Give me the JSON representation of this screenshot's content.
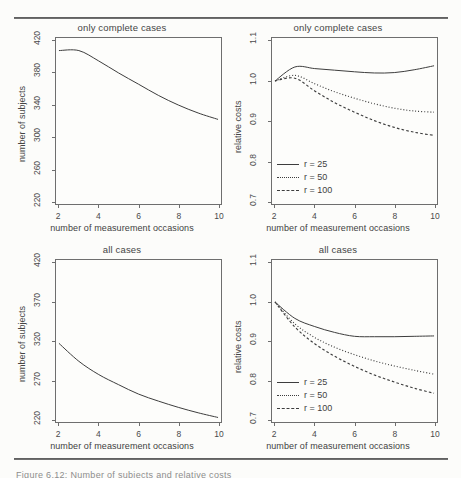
{
  "page": {
    "caption_sliver": "Figure 6.12: Number of subjects and relative costs"
  },
  "axis": {
    "x_label": "number of measurement occasions",
    "x_ticks": [
      "2",
      "4",
      "6",
      "8",
      "10"
    ],
    "y_label_subjects": "number of subjects",
    "y_label_costs": "relative costs",
    "y_ticks_tl": [
      "220",
      "260",
      "300",
      "340",
      "380",
      "420"
    ],
    "y_ticks_bl": [
      "220",
      "270",
      "320",
      "370",
      "420"
    ],
    "y_ticks_right": [
      "0.7",
      "0.8",
      "0.9",
      "1.0",
      "1.1"
    ]
  },
  "legend": {
    "items": [
      {
        "label": "r = 25",
        "style": "solid"
      },
      {
        "label": "r = 50",
        "style": "dotted"
      },
      {
        "label": "r = 100",
        "style": "dashed"
      }
    ]
  },
  "titles": {
    "complete": "only complete cases",
    "all": "all cases"
  },
  "chart_data": [
    {
      "id": "top-left",
      "type": "line",
      "title": "only complete cases",
      "xlabel": "number of measurement occasions",
      "ylabel": "number of subjects",
      "xlim": [
        2,
        10
      ],
      "ylim": [
        220,
        420
      ],
      "xticks": [
        2,
        4,
        6,
        8,
        10
      ],
      "yticks": [
        220,
        260,
        300,
        340,
        380,
        420
      ],
      "grid": false,
      "legend": "none",
      "series": [
        {
          "name": "number of subjects",
          "style": "solid",
          "x": [
            2,
            3,
            4,
            5,
            6,
            7,
            8,
            9,
            10
          ],
          "values": [
            408,
            408,
            395,
            380,
            366,
            352,
            340,
            330,
            322
          ]
        }
      ]
    },
    {
      "id": "top-right",
      "type": "line",
      "title": "only complete cases",
      "xlabel": "number of measurement occasions",
      "ylabel": "relative costs",
      "xlim": [
        2,
        10
      ],
      "ylim": [
        0.7,
        1.1
      ],
      "xticks": [
        2,
        4,
        6,
        8,
        10
      ],
      "yticks": [
        0.7,
        0.8,
        0.9,
        1.0,
        1.1
      ],
      "grid": false,
      "legend": "bottom-left",
      "series": [
        {
          "name": "r = 25",
          "style": "solid",
          "x": [
            2,
            3,
            4,
            5,
            6,
            7,
            8,
            9,
            10
          ],
          "values": [
            1.0,
            1.035,
            1.031,
            1.027,
            1.023,
            1.02,
            1.021,
            1.028,
            1.038
          ]
        },
        {
          "name": "r = 50",
          "style": "dotted",
          "x": [
            2,
            3,
            4,
            5,
            6,
            7,
            8,
            9,
            10
          ],
          "values": [
            1.0,
            1.014,
            0.993,
            0.973,
            0.957,
            0.943,
            0.932,
            0.925,
            0.922
          ]
        },
        {
          "name": "r = 100",
          "style": "dashed",
          "x": [
            2,
            3,
            4,
            5,
            6,
            7,
            8,
            9,
            10
          ],
          "values": [
            1.0,
            1.007,
            0.975,
            0.946,
            0.922,
            0.901,
            0.884,
            0.872,
            0.864
          ]
        }
      ]
    },
    {
      "id": "bottom-left",
      "type": "line",
      "title": "all cases",
      "xlabel": "number of measurement occasions",
      "ylabel": "number of subjects",
      "xlim": [
        2,
        10
      ],
      "ylim": [
        220,
        420
      ],
      "xticks": [
        2,
        4,
        6,
        8,
        10
      ],
      "yticks": [
        220,
        270,
        320,
        370,
        420
      ],
      "grid": false,
      "legend": "none",
      "series": [
        {
          "name": "number of subjects",
          "style": "solid",
          "x": [
            2,
            3,
            4,
            5,
            6,
            7,
            8,
            9,
            10
          ],
          "values": [
            317,
            294,
            277,
            264,
            252,
            243,
            235,
            228,
            222
          ]
        }
      ]
    },
    {
      "id": "bottom-right",
      "type": "line",
      "title": "all cases",
      "xlabel": "number of measurement occasions",
      "ylabel": "relative costs",
      "xlim": [
        2,
        10
      ],
      "ylim": [
        0.7,
        1.1
      ],
      "xticks": [
        2,
        4,
        6,
        8,
        10
      ],
      "yticks": [
        0.7,
        0.8,
        0.9,
        1.0,
        1.1
      ],
      "grid": false,
      "legend": "bottom-left",
      "series": [
        {
          "name": "r = 25",
          "style": "solid",
          "x": [
            2,
            3,
            4,
            5,
            6,
            7,
            8,
            9,
            10
          ],
          "values": [
            1.0,
            0.958,
            0.937,
            0.922,
            0.912,
            0.911,
            0.911,
            0.912,
            0.913
          ]
        },
        {
          "name": "r = 50",
          "style": "dotted",
          "x": [
            2,
            3,
            4,
            5,
            6,
            7,
            8,
            9,
            10
          ],
          "values": [
            1.0,
            0.944,
            0.909,
            0.884,
            0.865,
            0.849,
            0.836,
            0.825,
            0.815
          ]
        },
        {
          "name": "r = 100",
          "style": "dashed",
          "x": [
            2,
            3,
            4,
            5,
            6,
            7,
            8,
            9,
            10
          ],
          "values": [
            1.0,
            0.936,
            0.893,
            0.861,
            0.835,
            0.813,
            0.795,
            0.779,
            0.766
          ]
        }
      ]
    }
  ]
}
